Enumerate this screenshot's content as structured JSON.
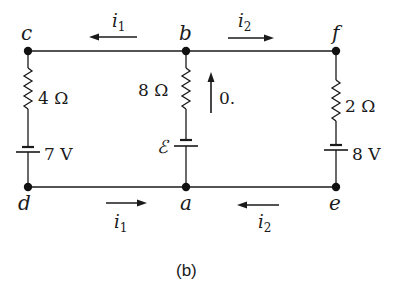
{
  "diagram": {
    "type": "circuit",
    "caption": "(b)",
    "nodes": {
      "a": "a",
      "b": "b",
      "c": "c",
      "d": "d",
      "e": "e",
      "f": "f"
    },
    "components": {
      "left_resistor": "4 Ω",
      "middle_resistor": "8 Ω",
      "right_resistor": "2 Ω",
      "left_battery": "7 V",
      "middle_battery": "ℰ",
      "right_battery": "8 V"
    },
    "currents": {
      "top_left": {
        "label": "i",
        "sub": "1",
        "direction": "left"
      },
      "top_right": {
        "label": "i",
        "sub": "2",
        "direction": "right"
      },
      "bottom_left": {
        "label": "i",
        "sub": "1",
        "direction": "right"
      },
      "bottom_right": {
        "label": "i",
        "sub": "2",
        "direction": "left"
      },
      "middle": {
        "label": "0.",
        "direction": "up"
      }
    },
    "colors": {
      "wire": "#1a1a1a",
      "background": "#ffffff"
    }
  }
}
